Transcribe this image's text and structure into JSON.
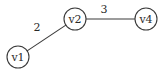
{
  "diagram": {
    "type": "weighted-graph",
    "colors": {
      "background": "#ffffff",
      "stroke": "#3a3a3a",
      "text": "#2a2a2a"
    },
    "nodes": [
      {
        "id": "v1",
        "label": "v1",
        "cx": 18,
        "cy": 57,
        "r": 11
      },
      {
        "id": "v2",
        "label": "v2",
        "cx": 75,
        "cy": 19,
        "r": 11
      },
      {
        "id": "v4",
        "label": "v4",
        "cx": 146,
        "cy": 19,
        "r": 11
      }
    ],
    "edges": [
      {
        "from": "v1",
        "to": "v2",
        "weight": "2",
        "label_x": 37,
        "label_y": 31
      },
      {
        "from": "v2",
        "to": "v4",
        "weight": "3",
        "label_x": 104,
        "label_y": 13
      }
    ]
  }
}
